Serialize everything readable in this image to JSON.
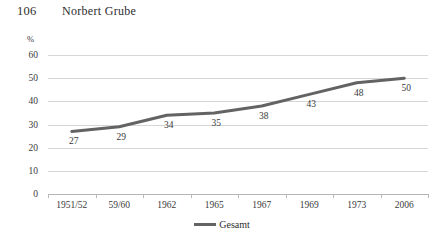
{
  "header": {
    "page_number": "106",
    "running_title": "Norbert Grube"
  },
  "chart_data": {
    "type": "line",
    "title": "",
    "subtitle": "",
    "xlabel": "",
    "ylabel": "",
    "unit_label": "%",
    "categories": [
      "1951/52",
      "59/60",
      "1962",
      "1965",
      "1967",
      "1969",
      "1973",
      "2006"
    ],
    "series": [
      {
        "name": "Gesamt",
        "values": [
          27,
          29,
          34,
          35,
          38,
          43,
          48,
          50
        ],
        "color": "#636363"
      }
    ],
    "point_labels": [
      "27",
      "29",
      "34",
      "35",
      "38",
      "43",
      "48",
      "50"
    ],
    "ylim": [
      0,
      60
    ],
    "yticks": [
      60,
      50,
      40,
      30,
      20,
      10,
      0
    ],
    "ytick_labels": [
      "60",
      "50",
      "40",
      "30",
      "20",
      "10",
      "0"
    ],
    "grid": true,
    "legend_position": "bottom",
    "legend_entries": [
      "Gesamt"
    ]
  },
  "legend": {
    "label": "Gesamt"
  },
  "colors": {
    "line": "#636363",
    "gridline": "#d6d6d6",
    "axis": "#b5b5b5",
    "text": "#3a3a3a"
  }
}
